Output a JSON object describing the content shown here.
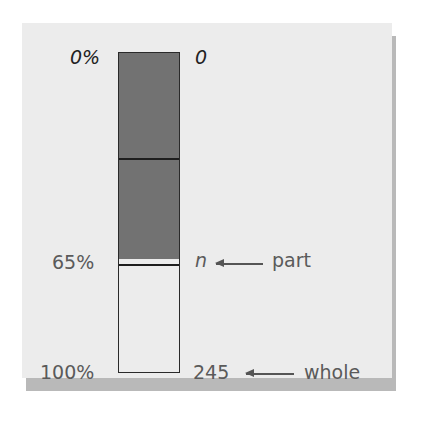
{
  "diagram": {
    "type": "percent bar model",
    "left_labels": {
      "top": "0%",
      "middle": "65%",
      "bottom": "100%"
    },
    "right_labels": {
      "top": "0",
      "middle": "n",
      "bottom": "245"
    },
    "annotations": {
      "part": "part",
      "whole": "whole"
    },
    "colors": {
      "shaded": "#727272",
      "unshaded": "#ececec",
      "background": "#ececec",
      "shadow": "#b9b9b9"
    }
  }
}
